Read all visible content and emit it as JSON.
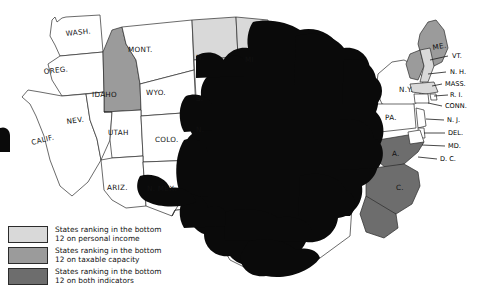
{
  "map": {
    "title": "United States choropleth map of state fiscal rankings",
    "background_color": "#ffffff",
    "outline_color": "#2b2b2b",
    "redaction": {
      "name": "black-scribble-redaction",
      "description": "Large hand-drawn black scribble obscuring the Midwest and South",
      "color": "#0a0a0a"
    },
    "shading_colors": {
      "personal_income": "#d9d9d9",
      "taxable_capacity": "#9b9b9b",
      "both_indicators": "#6d6d6d",
      "unshaded": "#ffffff"
    },
    "labels": [
      {
        "id": "wash",
        "text": "WASH.",
        "x": 66,
        "y": 36,
        "rotate": -6,
        "class": "lbl"
      },
      {
        "id": "oreg",
        "text": "OREG.",
        "x": 44,
        "y": 74,
        "rotate": -6,
        "class": "lbl"
      },
      {
        "id": "idaho",
        "text": "IDAHO",
        "x": 92,
        "y": 97,
        "rotate": 0,
        "class": "lbl"
      },
      {
        "id": "mont",
        "text": "MONT.",
        "x": 128,
        "y": 52,
        "rotate": 0,
        "class": "lbl"
      },
      {
        "id": "wyo",
        "text": "WYO.",
        "x": 146,
        "y": 95,
        "rotate": 0,
        "class": "lbl"
      },
      {
        "id": "nev",
        "text": "NEV.",
        "x": 67,
        "y": 124,
        "rotate": -8,
        "class": "lbl"
      },
      {
        "id": "calif",
        "text": "CALIF.",
        "x": 32,
        "y": 145,
        "rotate": -14,
        "class": "lbl"
      },
      {
        "id": "utah",
        "text": "UTAH",
        "x": 108,
        "y": 135,
        "rotate": 0,
        "class": "lbl"
      },
      {
        "id": "colo",
        "text": "COLO.",
        "x": 155,
        "y": 142,
        "rotate": 0,
        "class": "lbl"
      },
      {
        "id": "ariz",
        "text": "ARIZ.",
        "x": 107,
        "y": 190,
        "rotate": 0,
        "class": "lbl"
      },
      {
        "id": "nmex",
        "text": "N. MEX.",
        "x": 147,
        "y": 191,
        "rotate": 0,
        "class": "lbl"
      },
      {
        "id": "ndak",
        "text": "N.",
        "x": 196,
        "y": 60,
        "rotate": 0,
        "class": "lbl"
      },
      {
        "id": "sdak",
        "text": "S.",
        "x": 196,
        "y": 101,
        "rotate": 0,
        "class": "lbl"
      },
      {
        "id": "nebr",
        "text": "N.",
        "x": 196,
        "y": 132,
        "rotate": 0,
        "class": "lbl"
      },
      {
        "id": "minn",
        "text": "MI",
        "x": 245,
        "y": 62,
        "rotate": 0,
        "class": "lbl"
      },
      {
        "id": "me",
        "text": "ME.",
        "x": 433,
        "y": 50,
        "rotate": -10,
        "class": "lbl"
      },
      {
        "id": "vt",
        "text": "VT.",
        "x": 452,
        "y": 58,
        "rotate": 0,
        "class": "lbl-sm"
      },
      {
        "id": "nh",
        "text": "N. H.",
        "x": 450,
        "y": 74,
        "rotate": 0,
        "class": "lbl-sm"
      },
      {
        "id": "mass",
        "text": "MASS.",
        "x": 445,
        "y": 86,
        "rotate": 0,
        "class": "lbl-sm"
      },
      {
        "id": "ri",
        "text": "R. I.",
        "x": 450,
        "y": 97,
        "rotate": 0,
        "class": "lbl-sm"
      },
      {
        "id": "conn",
        "text": "CONN.",
        "x": 445,
        "y": 108,
        "rotate": 0,
        "class": "lbl-sm"
      },
      {
        "id": "ny",
        "text": "N.Y.",
        "x": 399,
        "y": 92,
        "rotate": 0,
        "class": "lbl"
      },
      {
        "id": "pa",
        "text": "PA.",
        "x": 385,
        "y": 120,
        "rotate": 0,
        "class": "lbl"
      },
      {
        "id": "nj",
        "text": "N. J.",
        "x": 447,
        "y": 122,
        "rotate": 0,
        "class": "lbl-sm"
      },
      {
        "id": "del",
        "text": "DEL.",
        "x": 448,
        "y": 135,
        "rotate": 0,
        "class": "lbl-sm"
      },
      {
        "id": "md",
        "text": "MD.",
        "x": 448,
        "y": 148,
        "rotate": 0,
        "class": "lbl-sm"
      },
      {
        "id": "dc",
        "text": "D. C.",
        "x": 440,
        "y": 161,
        "rotate": 0,
        "class": "lbl-sm"
      },
      {
        "id": "va",
        "text": "A.",
        "x": 392,
        "y": 156,
        "rotate": 0,
        "class": "lbl"
      },
      {
        "id": "carolina",
        "text": "C.",
        "x": 396,
        "y": 190,
        "rotate": 0,
        "class": "lbl"
      }
    ]
  },
  "legend": {
    "name": "map-legend",
    "entries": [
      {
        "swatch_class": "sw-income",
        "color": "#d9d9d9",
        "line1": "States ranking in the bottom",
        "line2": "12 on personal income"
      },
      {
        "swatch_class": "sw-taxable",
        "color": "#9b9b9b",
        "line1": "States ranking in the bottom",
        "line2": "12 on taxable capacity"
      },
      {
        "swatch_class": "sw-both",
        "color": "#6d6d6d",
        "line1": "States ranking in the bottom",
        "line2": "12 on both indicators"
      }
    ]
  },
  "artifacts": {
    "bleed_text": ""
  }
}
